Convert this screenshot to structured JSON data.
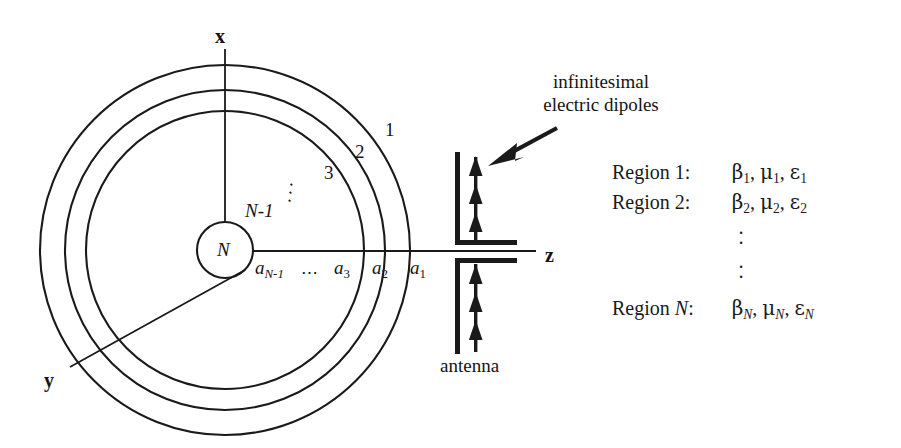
{
  "figure": {
    "background_color": "#ffffff",
    "line_color": "#1a1a1a"
  },
  "axes": {
    "x_label": "x",
    "y_label": "y",
    "z_label": "z"
  },
  "core": {
    "label": "N"
  },
  "rings": {
    "labels": [
      "1",
      "2",
      "3"
    ],
    "inner_label": "N-1",
    "diagonal_dots": "⋰"
  },
  "radii": {
    "a_n_minus_1": {
      "base": "a",
      "sub": "N-1"
    },
    "dots": "⋯",
    "a3": {
      "base": "a",
      "sub": "3"
    },
    "a2": {
      "base": "a",
      "sub": "2"
    },
    "a1": {
      "base": "a",
      "sub": "1"
    }
  },
  "callout": {
    "line1": "infinitesimal",
    "line2": "electric dipoles",
    "arrow_name": "pointer-arrow"
  },
  "antenna": {
    "label": "antenna",
    "upper_dipole_count": 3,
    "lower_dipole_count": 3
  },
  "regions": {
    "rows": [
      {
        "name": "Region 1:",
        "name_plain": "Region ",
        "name_italic": "",
        "index": "1",
        "params": "β₁, μ₁, ε₁",
        "beta": "β",
        "mu": "μ",
        "eps": "ε",
        "sub": "1",
        "sub_italic": false
      },
      {
        "name": "Region 2:",
        "name_plain": "Region ",
        "name_italic": "",
        "index": "2",
        "params": "β₂, μ₂, ε₂",
        "beta": "β",
        "mu": "μ",
        "eps": "ε",
        "sub": "2",
        "sub_italic": false
      },
      {
        "name": "Region N:",
        "name_plain": "Region ",
        "name_italic": "N",
        "index": "N",
        "params": "β_N, μ_N, ε_N",
        "beta": "β",
        "mu": "μ",
        "eps": "ε",
        "sub": "N",
        "sub_italic": true
      }
    ],
    "vertical_dots_1": "··",
    "vertical_dots_2": "··",
    "colon": ":",
    "comma": ","
  }
}
